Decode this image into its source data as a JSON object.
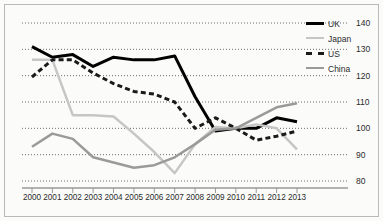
{
  "chart_data": {
    "type": "line",
    "title": "",
    "subtitle": "",
    "xlabel": "",
    "ylabel": "",
    "categories": [
      "2000",
      "2001",
      "2002",
      "2003",
      "2004",
      "2005",
      "2006",
      "2007",
      "2008",
      "2009",
      "2010",
      "2011",
      "2012",
      "2013"
    ],
    "x": [
      2000,
      2001,
      2002,
      2003,
      2004,
      2005,
      2006,
      2007,
      2008,
      2009,
      2010,
      2011,
      2012,
      2013
    ],
    "ylim": [
      80,
      140
    ],
    "yticks": [
      80,
      90,
      100,
      110,
      120,
      130,
      140
    ],
    "ytick_labels": [
      "80",
      "90",
      "100",
      "110",
      "120",
      "130",
      "140"
    ],
    "grid": "horizontal-dotted",
    "legend_position": "top-right",
    "series": [
      {
        "name": "UK",
        "color": "#000000",
        "style": "solid",
        "width": 3,
        "values": [
          131,
          127,
          128,
          123.5,
          127,
          126,
          126,
          127.5,
          112,
          99,
          100,
          100,
          104,
          102.5
        ]
      },
      {
        "name": "Japan",
        "color": "#c6c6c6",
        "style": "solid",
        "width": 2.5,
        "values": [
          126,
          126,
          105,
          105,
          104.5,
          98,
          91,
          83,
          94,
          100.5,
          100,
          101.5,
          100,
          92
        ]
      },
      {
        "name": "US",
        "color": "#1a1a1a",
        "style": "dashed",
        "width": 3,
        "values": [
          119.5,
          126,
          126,
          121,
          117,
          114,
          113,
          110,
          100,
          104,
          100,
          95.5,
          97,
          99
        ]
      },
      {
        "name": "China",
        "color": "#9a9a9a",
        "style": "solid",
        "width": 2.5,
        "values": [
          93,
          98,
          96,
          89,
          87,
          85,
          86,
          89,
          94,
          99.5,
          100,
          104,
          108,
          109.5
        ]
      }
    ]
  },
  "legend": {
    "items": [
      {
        "label": "UK"
      },
      {
        "label": "Japan"
      },
      {
        "label": "US"
      },
      {
        "label": "China"
      }
    ]
  }
}
